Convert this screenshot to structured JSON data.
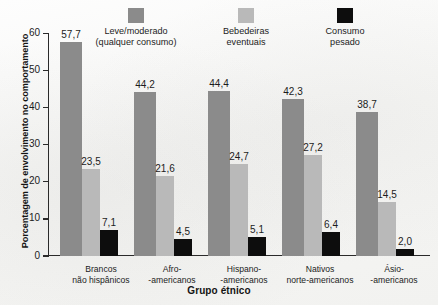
{
  "chart_data": {
    "type": "bar",
    "title": "",
    "xlabel": "Grupo étnico",
    "ylabel": "Porcentagem de envolvimento no comportamento",
    "ylim": [
      0,
      60
    ],
    "yticks": [
      "0",
      "10",
      "20",
      "30",
      "40",
      "50",
      "60"
    ],
    "grid": false,
    "legend_position": "top",
    "categories": [
      "Brancos\nnão hispânicos",
      "Afro-\n-americanos",
      "Hispano-\n-americanos",
      "Nativos\nnorte-americanos",
      "Ásio-\n-americanos"
    ],
    "category_lines": [
      [
        "Brancos",
        "não hispânicos"
      ],
      [
        "Afro-",
        "-americanos"
      ],
      [
        "Hispano-",
        "-americanos"
      ],
      [
        "Nativos",
        "norte-americanos"
      ],
      [
        "Ásio-",
        "-americanos"
      ]
    ],
    "series": [
      {
        "name": "Leve/moderado (qualquer consumo)",
        "color": "#8b8b8b",
        "values": [
          57.7,
          44.2,
          44.4,
          42.3,
          38.7
        ],
        "labels": [
          "57,7",
          "44,2",
          "44,4",
          "42,3",
          "38,7"
        ]
      },
      {
        "name": "Bebedeiras eventuais",
        "color": "#b9b9b9",
        "values": [
          23.5,
          21.6,
          24.7,
          27.2,
          14.5
        ],
        "labels": [
          "23,5",
          "21,6",
          "24,7",
          "27,2",
          "14,5"
        ]
      },
      {
        "name": "Consumo pesado",
        "color": "#0d0d0d",
        "values": [
          7.1,
          4.5,
          5.1,
          6.4,
          2.0
        ],
        "labels": [
          "7,1",
          "4,5",
          "5,1",
          "6,4",
          "2,0"
        ]
      }
    ]
  },
  "legend": {
    "items": [
      {
        "line1": "Leve/moderado",
        "line2": "(qualquer consumo)",
        "swatch": "dark-gray-swatch"
      },
      {
        "line1": "Bebedeiras",
        "line2": "eventuais",
        "swatch": "light-gray-swatch"
      },
      {
        "line1": "Consumo",
        "line2": "pesado",
        "swatch": "black-swatch"
      }
    ]
  },
  "axes": {
    "y_title": "Porcentagem de envolvimento no comportamento",
    "x_title": "Grupo étnico"
  },
  "colors": {
    "series_light_moderate": "#8b8b8b",
    "series_binge": "#b9b9b9",
    "series_heavy": "#0d0d0d",
    "axis": "#2a2a2a",
    "text": "#1c1c1c"
  }
}
